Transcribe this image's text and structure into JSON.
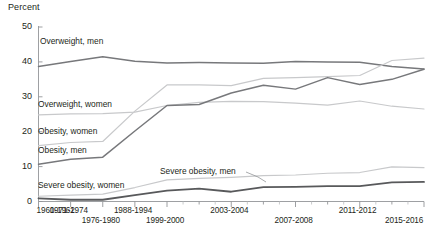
{
  "chart_data": {
    "type": "line",
    "title": "",
    "subtitle": "",
    "xlabel": "",
    "ylabel": "Percent",
    "ylim": [
      0,
      50
    ],
    "yticks": [
      0,
      10,
      20,
      30,
      40,
      50
    ],
    "ytick_labels": [
      "0",
      "10",
      "20",
      "30",
      "40",
      "50"
    ],
    "grid": false,
    "legend_position": "inline-labels",
    "x": [
      "1960-1962",
      "1971-1974",
      "1976-1980",
      "1988-1994",
      "1999-2000",
      "2001-2002",
      "2003-2004",
      "2005-2006",
      "2007-2008",
      "2009-2010",
      "2011-2012",
      "2013-2014",
      "2015-2016"
    ],
    "xtick_labels_shown": [
      "1960-1962",
      "1971-1974",
      "1976-1980",
      "1988-1994",
      "1999-2000",
      "2003-2004",
      "2007-2008",
      "2011-2012",
      "2015-2016"
    ],
    "series": [
      {
        "name": "Overweight, men",
        "label": "Overweight, men",
        "color": "#77787b",
        "width": 1.5,
        "values": [
          38.7,
          40.1,
          41.5,
          40.2,
          39.7,
          39.8,
          39.7,
          39.6,
          40.1,
          40.0,
          39.9,
          38.7,
          38.0
        ]
      },
      {
        "name": "Overweight, women",
        "label": "Overweight, women",
        "color": "#c8c9cb",
        "width": 1.2,
        "values": [
          24.8,
          25.1,
          25.2,
          25.6,
          27.5,
          28.4,
          28.7,
          28.6,
          28.2,
          27.6,
          28.8,
          27.3,
          26.5
        ]
      },
      {
        "name": "Obesity, women",
        "label": "Obesity, women",
        "color": "#c8c9cb",
        "width": 1.2,
        "values": [
          16.0,
          16.9,
          17.2,
          25.9,
          33.4,
          33.4,
          33.2,
          35.3,
          35.5,
          35.8,
          36.1,
          40.4,
          41.1
        ]
      },
      {
        "name": "Obesity, men",
        "label": "Obesity, men",
        "color": "#77787b",
        "width": 1.5,
        "values": [
          10.7,
          12.1,
          12.7,
          20.2,
          27.5,
          27.8,
          31.1,
          33.3,
          32.2,
          35.5,
          33.5,
          35.0,
          37.9
        ]
      },
      {
        "name": "Severe obesity, women",
        "label": "Severe obesity, women",
        "color": "#c8c9cb",
        "width": 1.2,
        "values": [
          1.5,
          1.8,
          2.1,
          4.0,
          6.2,
          6.6,
          6.9,
          7.4,
          7.6,
          8.1,
          8.3,
          9.9,
          9.7
        ]
      },
      {
        "name": "Severe obesity, men",
        "label": "Severe obesity, men",
        "color": "#58595b",
        "width": 1.8,
        "values": [
          0.9,
          0.5,
          0.5,
          1.8,
          3.1,
          3.7,
          2.8,
          4.1,
          4.2,
          4.4,
          4.4,
          5.5,
          5.6
        ]
      }
    ],
    "annotations": [
      {
        "name": "severe-obesity-men-leader-line",
        "text": ""
      }
    ]
  },
  "axis": {
    "unit_label": "Percent"
  }
}
